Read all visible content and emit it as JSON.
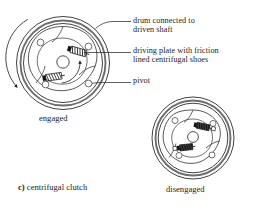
{
  "figure": {
    "caption_key": "c)",
    "caption_text": " centrifugal clutch",
    "background_color": "#ffffff",
    "ink_color": "#1d1d1d",
    "shoe_fill_color": "#111111"
  },
  "callouts": [
    {
      "id": "drum",
      "line1": "drum connected to",
      "line2": "driven shaft",
      "name": "callout-drum-connected-to-driven-shaft"
    },
    {
      "id": "plate",
      "line1": "driving plate with friction",
      "line2": "lined centrifugal shoes",
      "name": "callout-driving-plate-with-friction-lined-centrifugal-shoes"
    },
    {
      "id": "pivot",
      "line1": "pivot",
      "line2": "",
      "name": "callout-pivot"
    }
  ],
  "views": [
    {
      "id": "engaged",
      "label": "engaged",
      "center_x": 63,
      "center_y": 63,
      "outer_radius": 48,
      "description": "clutch shoes thrown outward contacting drum"
    },
    {
      "id": "disengaged",
      "label": "disengaged",
      "center_x": 193,
      "center_y": 138,
      "outer_radius": 42,
      "description": "clutch shoes retracted away from drum"
    }
  ],
  "annotations": {
    "rotation_arrow": "drum-rotation-arrow",
    "inner_rotation_arrow": "plate-rotation-arrow"
  }
}
